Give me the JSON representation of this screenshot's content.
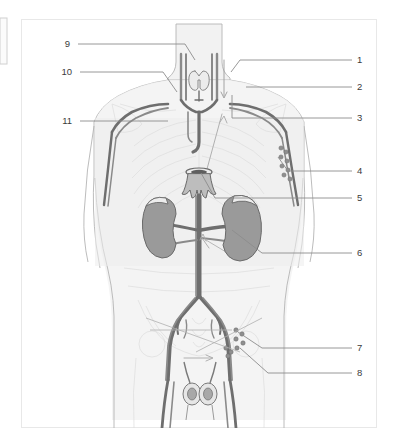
{
  "figure": {
    "type": "anatomical-illustration",
    "view": "anterior",
    "frame_color": "#e8e8e8",
    "background_color": "#ffffff"
  },
  "palette": {
    "body_fill": "#f2f2f2",
    "body_outline": "#b4b4b4",
    "skeleton_line": "#dcdcdc",
    "vessel_dark": "#6e6e6e",
    "vessel_mid": "#8a8a8a",
    "vessel_light": "#a8a8a8",
    "organ_fill": "#9a9a9a",
    "organ_outline": "#6a6a6a",
    "node_fill": "#8f8f8f",
    "leader_line": "#8c8c8c",
    "label_text": "#3b3b3b",
    "edge_artifact": "#d0d0d0"
  },
  "labels": {
    "left_column": [
      {
        "id": "label-9",
        "text": "9",
        "x": 70,
        "y": 47,
        "leader": "M 78 44 L 185 44 L 195 60"
      },
      {
        "id": "label-10",
        "text": "10",
        "x": 66,
        "y": 75,
        "leader": "M 80 72 L 163 72 L 177 92"
      },
      {
        "id": "label-11",
        "text": "11",
        "x": 66,
        "y": 124,
        "leader": "M 80 121 L 168 121"
      }
    ],
    "right_column": [
      {
        "id": "label-1",
        "text": "1",
        "x": 357,
        "y": 63,
        "leader": "M 352 60 L 240 60 L 231 72"
      },
      {
        "id": "label-2",
        "text": "2",
        "x": 357,
        "y": 90,
        "leader": "M 352 87 L 246 87"
      },
      {
        "id": "label-3",
        "text": "3",
        "x": 357,
        "y": 121,
        "leader": "M 352 118 L 232 118 L 232 95"
      },
      {
        "id": "label-4",
        "text": "4",
        "x": 357,
        "y": 174,
        "leader": "M 352 171 L 288 171 L 278 157"
      },
      {
        "id": "label-5",
        "text": "5",
        "x": 357,
        "y": 201,
        "leader": "M 352 198 L 215 198 L 201 173"
      },
      {
        "id": "label-6",
        "text": "6",
        "x": 357,
        "y": 256,
        "leader": "M 352 253 L 262 253 L 232 230"
      },
      {
        "id": "label-7",
        "text": "7",
        "x": 357,
        "y": 351,
        "leader": "M 352 348 L 262 348 L 238 332"
      },
      {
        "id": "label-8",
        "text": "8",
        "x": 357,
        "y": 376,
        "leader": "M 352 373 L 268 373 L 240 348"
      }
    ],
    "count": 11
  },
  "regions": {
    "neck": "thyroid gland and jugular / subclavian vessels",
    "thorax": "subclavian trunks, rib cage outline, thoracic duct",
    "abdomen": "kidneys, abdominal aorta, cisterna chyli",
    "pelvis": "iliac vessels, inguinal lymph nodes, testes"
  }
}
